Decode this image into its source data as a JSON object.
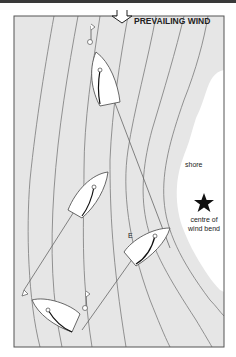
{
  "diagram": {
    "wind_label": "PREVAILING WIND",
    "shore_label": "shore",
    "bend_label_line1": "centre of",
    "bend_label_line2": "wind bend",
    "boat_marker_label": "E",
    "icons": {
      "wind_arrow": "down-arrow-icon",
      "bend_centre": "star-icon",
      "marks": "flag-buoy-icon"
    },
    "colors": {
      "water": "#e6e6e6",
      "shore": "#ffffff",
      "frame": "#555555",
      "isobar": "#777777",
      "boat": "#ffffff",
      "star": "#111111"
    }
  }
}
